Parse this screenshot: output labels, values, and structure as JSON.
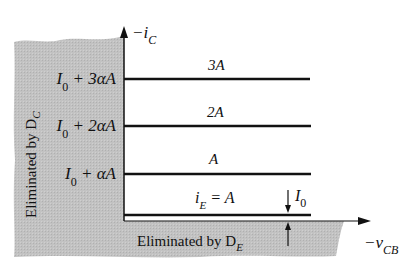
{
  "axes": {
    "y_label": "−i",
    "y_label_sub": "C",
    "x_label": "−v",
    "x_label_sub": "CB"
  },
  "regions": {
    "left": {
      "text": "Eliminated by D",
      "sub": "C"
    },
    "bottom": {
      "text": "Eliminated by D",
      "sub": "E"
    }
  },
  "levels": [
    {
      "left_label": {
        "i": "I",
        "sub": "0",
        "rest": " + 3αA"
      },
      "curve_label": "3A"
    },
    {
      "left_label": {
        "i": "I",
        "sub": "0",
        "rest": " + 2αA"
      },
      "curve_label": "2A"
    },
    {
      "left_label": {
        "i": "I",
        "sub": "0",
        "rest": " + αA"
      },
      "curve_label": "A"
    },
    {
      "curve_label_pre": "i",
      "curve_label_sub": "E",
      "curve_label_post": " = A"
    }
  ],
  "offset_marker": {
    "label": "I",
    "sub": "0"
  },
  "colors": {
    "shade": "#bdbdbd",
    "line": "#111111"
  }
}
